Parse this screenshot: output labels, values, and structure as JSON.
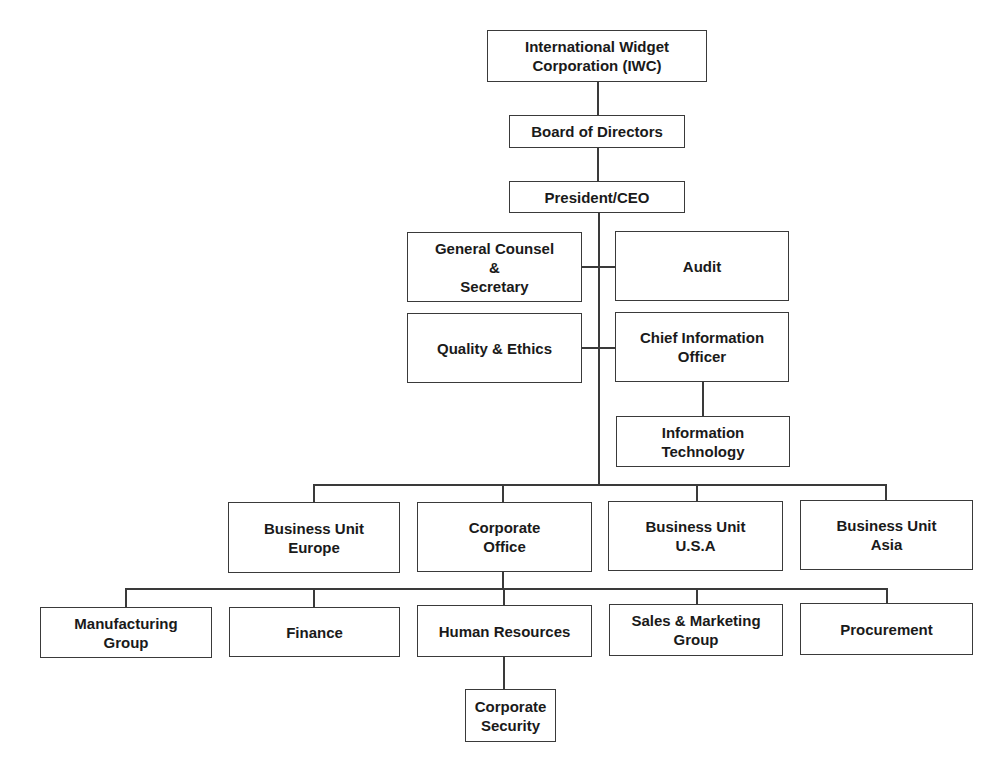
{
  "chart": {
    "type": "org-chart",
    "nodes": {
      "iwc": "International Widget\nCorporation (IWC)",
      "board": "Board of Directors",
      "president": "President/CEO",
      "general_counsel": "General Counsel\n&\nSecretary",
      "audit": "Audit",
      "quality_ethics": "Quality & Ethics",
      "cio": "Chief Information\nOfficer",
      "it": "Information\nTechnology",
      "bu_europe": "Business Unit\nEurope",
      "corporate_office": "Corporate\nOffice",
      "bu_usa": "Business Unit\nU.S.A",
      "bu_asia": "Business Unit\nAsia",
      "manufacturing": "Manufacturing\nGroup",
      "finance": "Finance",
      "human_resources": "Human Resources",
      "sales_marketing": "Sales & Marketing\nGroup",
      "procurement": "Procurement",
      "corporate_security": "Corporate\nSecurity"
    },
    "edges": [
      [
        "iwc",
        "board"
      ],
      [
        "board",
        "president"
      ],
      [
        "president",
        "general_counsel"
      ],
      [
        "president",
        "audit"
      ],
      [
        "president",
        "quality_ethics"
      ],
      [
        "president",
        "cio"
      ],
      [
        "cio",
        "it"
      ],
      [
        "president",
        "bu_europe"
      ],
      [
        "president",
        "corporate_office"
      ],
      [
        "president",
        "bu_usa"
      ],
      [
        "president",
        "bu_asia"
      ],
      [
        "corporate_office",
        "manufacturing"
      ],
      [
        "corporate_office",
        "finance"
      ],
      [
        "corporate_office",
        "human_resources"
      ],
      [
        "corporate_office",
        "sales_marketing"
      ],
      [
        "corporate_office",
        "procurement"
      ],
      [
        "human_resources",
        "corporate_security"
      ]
    ],
    "colors": {
      "line": "#3a3a3a",
      "text": "#1a1a1a",
      "background": "#ffffff"
    }
  }
}
